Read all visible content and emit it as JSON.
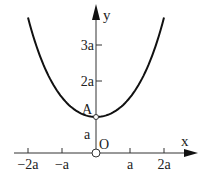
{
  "diagram": {
    "type": "catenary",
    "equation": "y = a cosh(x/a)",
    "x_range": [
      -2,
      2
    ],
    "axes": {
      "x_label": "x",
      "y_label": "y",
      "origin_label": "O"
    },
    "x_ticks": [
      {
        "value": -2,
        "label": "−2a"
      },
      {
        "value": -1,
        "label": "−a"
      },
      {
        "value": 1,
        "label": "a"
      },
      {
        "value": 2,
        "label": "2a"
      }
    ],
    "y_ticks": [
      {
        "value": 2,
        "label": "2a"
      },
      {
        "value": 3,
        "label": "3a"
      }
    ],
    "segment_label": {
      "value": 0.5,
      "label": "a"
    },
    "point": {
      "label": "A",
      "x": 0,
      "y": 1
    },
    "colors": {
      "curve": "#111111",
      "axis": "#333333"
    }
  }
}
